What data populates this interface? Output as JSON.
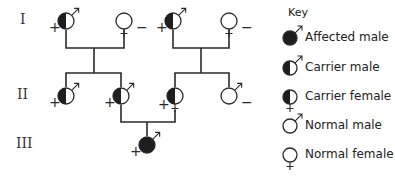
{
  "generations": [
    {
      "label": "I",
      "y": 21
    },
    {
      "label": "II",
      "y": 96
    },
    {
      "label": "III",
      "y": 145
    }
  ],
  "individuals": [
    {
      "id": "I-1",
      "sex": "male",
      "status": "carrier",
      "x": 66,
      "y": 21,
      "sign": "+"
    },
    {
      "id": "I-2",
      "sex": "female",
      "status": "normal",
      "x": 124,
      "y": 21,
      "sign": "−"
    },
    {
      "id": "I-3",
      "sex": "male",
      "status": "carrier",
      "x": 173,
      "y": 21,
      "sign": "+"
    },
    {
      "id": "I-4",
      "sex": "female",
      "status": "normal",
      "x": 229,
      "y": 21,
      "sign": "−"
    },
    {
      "id": "II-1",
      "sex": "male",
      "status": "carrier",
      "x": 66,
      "y": 96,
      "sign": "+"
    },
    {
      "id": "II-2",
      "sex": "male",
      "status": "carrier",
      "x": 121,
      "y": 96,
      "sign": "+"
    },
    {
      "id": "II-3",
      "sex": "female",
      "status": "carrier",
      "x": 175,
      "y": 96,
      "sign": "+"
    },
    {
      "id": "II-4",
      "sex": "male",
      "status": "normal",
      "x": 229,
      "y": 96,
      "sign": "−"
    },
    {
      "id": "III-1",
      "sex": "male",
      "status": "affected",
      "x": 147,
      "y": 145,
      "sign": "+"
    }
  ],
  "key": {
    "title": "Key",
    "items": [
      {
        "label": "Affected male",
        "sex": "male",
        "status": "affected",
        "y": 38
      },
      {
        "label": "Carrier male",
        "sex": "male",
        "status": "carrier",
        "y": 68
      },
      {
        "label": "Carrier female",
        "sex": "female",
        "status": "carrier",
        "y": 97
      },
      {
        "label": "Normal male",
        "sex": "male",
        "status": "normal",
        "y": 126
      },
      {
        "label": "Normal female",
        "sex": "female",
        "status": "normal",
        "y": 155
      }
    ]
  },
  "colors": {
    "line": "#2a2a2a",
    "fill": "#1e1e1e",
    "background": "#ffffff"
  }
}
